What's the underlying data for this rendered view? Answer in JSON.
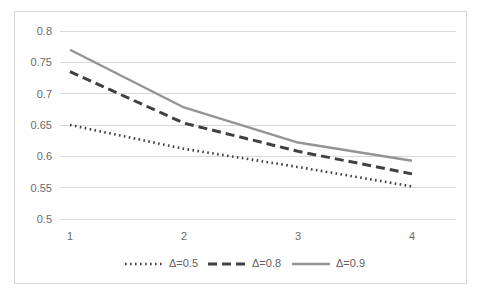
{
  "chart_data": {
    "type": "line",
    "title": "",
    "subtitle": "",
    "xlabel": "",
    "ylabel": "",
    "x": [
      1,
      2,
      3,
      4
    ],
    "categories": [
      "1",
      "2",
      "3",
      "4"
    ],
    "xtick_labels": [
      "1",
      "2",
      "3",
      "4"
    ],
    "ytick_labels": [
      "0.5",
      "0.55",
      "0.6",
      "0.65",
      "0.7",
      "0.75",
      "0.8"
    ],
    "ytick_values": [
      0.5,
      0.55,
      0.6,
      0.65,
      0.7,
      0.75,
      0.8
    ],
    "ylim": [
      0.5,
      0.8
    ],
    "xlim": [
      1,
      4
    ],
    "grid": true,
    "grid_axis": "y",
    "legend_position": "bottom",
    "series": [
      {
        "name": "Δ=0.5",
        "style": "dotted",
        "color": "#3f3f3f",
        "values": [
          0.65,
          0.612,
          0.583,
          0.552
        ]
      },
      {
        "name": "Δ=0.8",
        "style": "dashed",
        "color": "#404040",
        "values": [
          0.735,
          0.653,
          0.608,
          0.572
        ]
      },
      {
        "name": "Δ=0.9",
        "style": "solid",
        "color": "#949494",
        "values": [
          0.77,
          0.678,
          0.622,
          0.593
        ]
      }
    ]
  },
  "legend": {
    "items": [
      {
        "label": "Δ=0.5"
      },
      {
        "label": "Δ=0.8"
      },
      {
        "label": "Δ=0.9"
      }
    ]
  },
  "colors": {
    "grid": "#d9d9d9",
    "border": "#d8d8d8",
    "tick_text": "#6a6a6a",
    "legend_text": "#5f5f5f",
    "background": "#ffffff"
  }
}
